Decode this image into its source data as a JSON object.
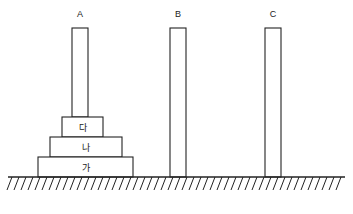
{
  "figure": {
    "title": "",
    "background_color": "#ffffff",
    "stroke_color": "#232323",
    "fill_color": "#ffffff",
    "width": 353,
    "height": 214
  },
  "columns": [
    {
      "id": "A",
      "label": "A",
      "label_x": 80,
      "label_y": 17,
      "x": 72,
      "y": 28,
      "width": 16,
      "height": 89,
      "rests_on": "block-da"
    },
    {
      "id": "B",
      "label": "B",
      "label_x": 178,
      "label_y": 17,
      "x": 170,
      "y": 28,
      "width": 16,
      "height": 149,
      "rests_on": "ground"
    },
    {
      "id": "C",
      "label": "C",
      "label_x": 273,
      "label_y": 17,
      "x": 265,
      "y": 28,
      "width": 16,
      "height": 149,
      "rests_on": "ground"
    }
  ],
  "blocks": [
    {
      "id": "block-da",
      "label": "다",
      "x": 62,
      "y": 117,
      "width": 41,
      "height": 20,
      "label_x": 82.5,
      "label_y": 131
    },
    {
      "id": "block-na",
      "label": "나",
      "x": 50,
      "y": 137,
      "width": 72,
      "height": 20,
      "label_x": 86,
      "label_y": 151
    },
    {
      "id": "block-ga",
      "label": "가",
      "x": 38,
      "y": 157,
      "width": 95,
      "height": 20,
      "label_x": 85.5,
      "label_y": 171
    }
  ],
  "ground": {
    "line_y": 177,
    "line_x_start": 8,
    "line_x_end": 345,
    "hatch_count": 48,
    "hatch_spacing": 7,
    "hatch_depth": 13,
    "hatch_slant": 5
  }
}
